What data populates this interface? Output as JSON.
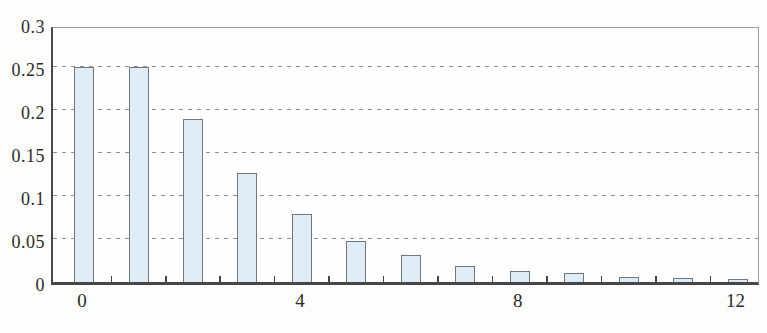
{
  "figure": {
    "title": "",
    "background_color": "#fdfdfb"
  },
  "chart_data": {
    "type": "bar",
    "title": "",
    "xlabel": "",
    "ylabel": "",
    "x": [
      0,
      1,
      2,
      3,
      4,
      5,
      6,
      7,
      8,
      9,
      10,
      11,
      12
    ],
    "values": [
      0.25,
      0.25,
      0.19,
      0.127,
      0.079,
      0.048,
      0.031,
      0.019,
      0.013,
      0.01,
      0.006,
      0.005,
      0.004
    ],
    "xlim": [
      -0.57,
      12.43
    ],
    "ylim": [
      0,
      0.3
    ],
    "y_ticks": [
      {
        "v": 0,
        "label": "0"
      },
      {
        "v": 0.05,
        "label": "0.05"
      },
      {
        "v": 0.1,
        "label": "0.1"
      },
      {
        "v": 0.15,
        "label": "0.15"
      },
      {
        "v": 0.2,
        "label": "0.2"
      },
      {
        "v": 0.25,
        "label": "0.25"
      },
      {
        "v": 0.3,
        "label": "0.3"
      }
    ],
    "x_ticks": [
      {
        "v": 0,
        "label": "0"
      },
      {
        "v": 4,
        "label": "4"
      },
      {
        "v": 8,
        "label": "8"
      },
      {
        "v": 12,
        "label": "12"
      }
    ],
    "x_minor_ticks": [
      0.5,
      1.5,
      2.5,
      3.5,
      4.5,
      5.5,
      6.5,
      7.5,
      8.5,
      9.5,
      10.5,
      11.5
    ],
    "grid": "horizontal-dashed",
    "legend": "none",
    "colors": {
      "bar_fill": "#e0ecf5",
      "bar_border": "#6e7880",
      "axis": "#474747",
      "frame": "#9b9b9b",
      "grid": "#8f8f8f",
      "text": "#2b2b2b"
    }
  }
}
